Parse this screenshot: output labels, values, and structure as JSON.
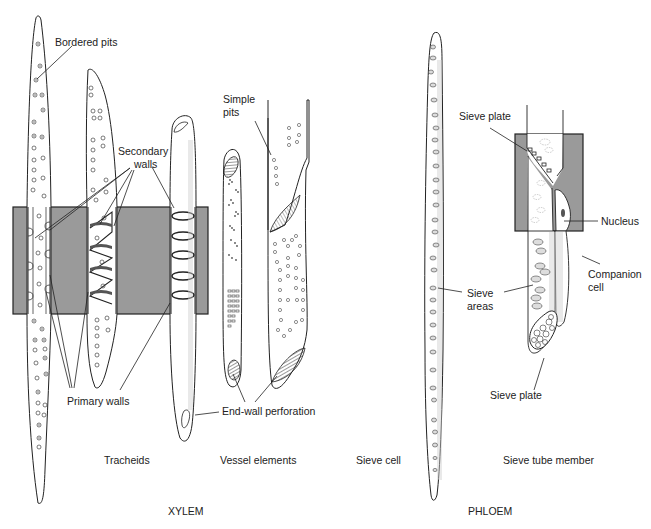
{
  "figure": {
    "colors": {
      "band": "#9a9a9a",
      "band_border": "#222222",
      "cell_fill": "#ffffff",
      "stroke": "#222222",
      "stipple": "#bdbdbd"
    },
    "xylem": {
      "group_title": "XYLEM",
      "captions": {
        "tracheids": "Tracheids",
        "vessel_elements": "Vessel elements"
      },
      "labels": {
        "bordered_pits": "Bordered pits",
        "secondary_walls_line1": "Secondary",
        "secondary_walls_line2": "walls",
        "simple_pits_line1": "Simple",
        "simple_pits_line2": "pits",
        "primary_walls": "Primary walls",
        "end_wall_perforation": "End-wall perforation"
      }
    },
    "phloem": {
      "group_title": "PHLOEM",
      "captions": {
        "sieve_cell": "Sieve cell",
        "sieve_tube_member": "Sieve tube member"
      },
      "labels": {
        "sieve_plate_top": "Sieve plate",
        "nucleus": "Nucleus",
        "companion_cell_line1": "Companion",
        "companion_cell_line2": "cell",
        "sieve_areas_line1": "Sieve",
        "sieve_areas_line2": "areas",
        "sieve_plate_bottom": "Sieve plate"
      }
    }
  }
}
